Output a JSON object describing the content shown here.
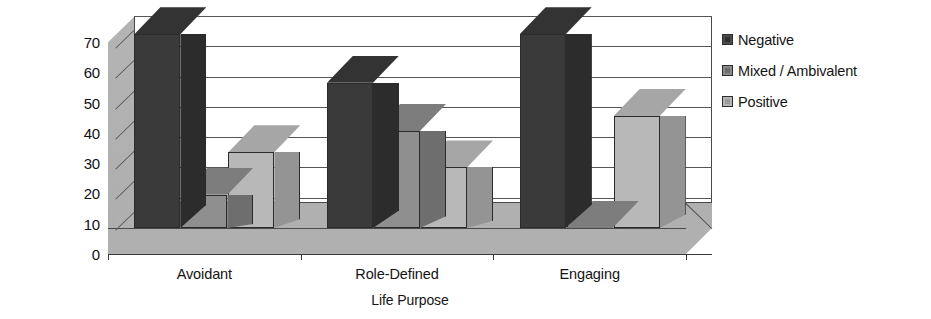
{
  "chart_data": {
    "type": "bar",
    "subtype": "grouped-3d-column",
    "title": "",
    "xlabel": "Life Purpose",
    "ylabel": "Worldview Percentage within Life Purpose",
    "ylabel_lines": [
      "Worldview Percentage",
      "within Life Purpose"
    ],
    "categories": [
      "Avoidant",
      "Role-Defined",
      "Engaging"
    ],
    "series": [
      {
        "name": "Negative",
        "values": [
          64,
          48,
          64
        ],
        "color": "#3a3a3a"
      },
      {
        "name": "Mixed / Ambivalent",
        "values": [
          11,
          32,
          0
        ],
        "color": "#8f8f8f"
      },
      {
        "name": "Positive",
        "values": [
          25,
          20,
          37
        ],
        "color": "#b8b8b8"
      }
    ],
    "ylim": [
      0,
      70
    ],
    "yticks": [
      0,
      10,
      20,
      30,
      40,
      50,
      60,
      70
    ],
    "ytick_labels": [
      "0",
      "10",
      "20",
      "30",
      "40",
      "50",
      "60",
      "70"
    ],
    "grid": true,
    "grid_axis": "y",
    "legend_position": "right",
    "legend_entries": [
      "Negative",
      "Mixed / Ambivalent",
      "Positive"
    ],
    "units": "percent",
    "background_color": "#ffffff",
    "axis_color": "#3a3a3a"
  }
}
